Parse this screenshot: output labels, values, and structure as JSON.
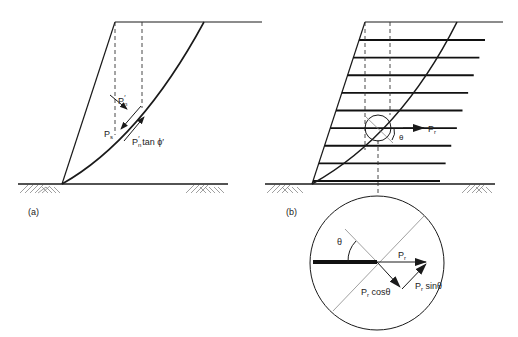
{
  "figure": {
    "panel_a": {
      "label": "(a)",
      "normal_force": {
        "P": "P",
        "sub": "n",
        "prime": "′"
      },
      "shear_force": {
        "P": "P",
        "sub": "s"
      },
      "resistance": {
        "P": "P",
        "sub": "n",
        "prime": "′",
        "rest": " tan ϕ′"
      }
    },
    "panel_b": {
      "label": "(b)",
      "reinforcement_count": 9,
      "angle_label": "θ",
      "force_label": {
        "P": "P",
        "sub": "r"
      }
    },
    "detail": {
      "angle_label": "θ",
      "force": {
        "P": "P",
        "sub": "r"
      },
      "cos_component": {
        "P": "P",
        "sub": "r",
        "rest": " cosθ"
      },
      "sin_component": {
        "P": "P",
        "sub": "r",
        "rest": " sinθ"
      }
    }
  }
}
